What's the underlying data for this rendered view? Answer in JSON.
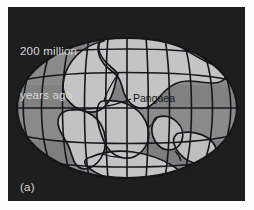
{
  "figure": {
    "panel_letter": "(a)",
    "age_caption_line1": "200 million",
    "age_caption_line2": "years ago",
    "supercontinent_label": "Pangaea",
    "caption_text_color": "#d9d9d9",
    "panel_background_color": "#1e1e1e",
    "page_background_color": "#ffffff",
    "ocean_color": "#8a8a8a",
    "ocean_shade_color": "#7b7b7b",
    "land_color": "#c2c2c2",
    "land_shade_color": "#a8a8a8",
    "graticule_color": "#14161a",
    "coastline_color": "#14161a",
    "label_color": "#15181a"
  },
  "map": {
    "projection": "elliptical",
    "globe_center_x": 127,
    "globe_center_y": 108,
    "globe_radius_x": 110,
    "globe_radius_y": 70,
    "meridian_count": 11,
    "parallel_count": 5,
    "landmass_names": [
      "Laurasia",
      "Gondwana",
      "North America",
      "Eurasia",
      "South America",
      "Africa",
      "India",
      "Australia",
      "Antarctica"
    ],
    "leader_line_label": "Pangaea"
  }
}
